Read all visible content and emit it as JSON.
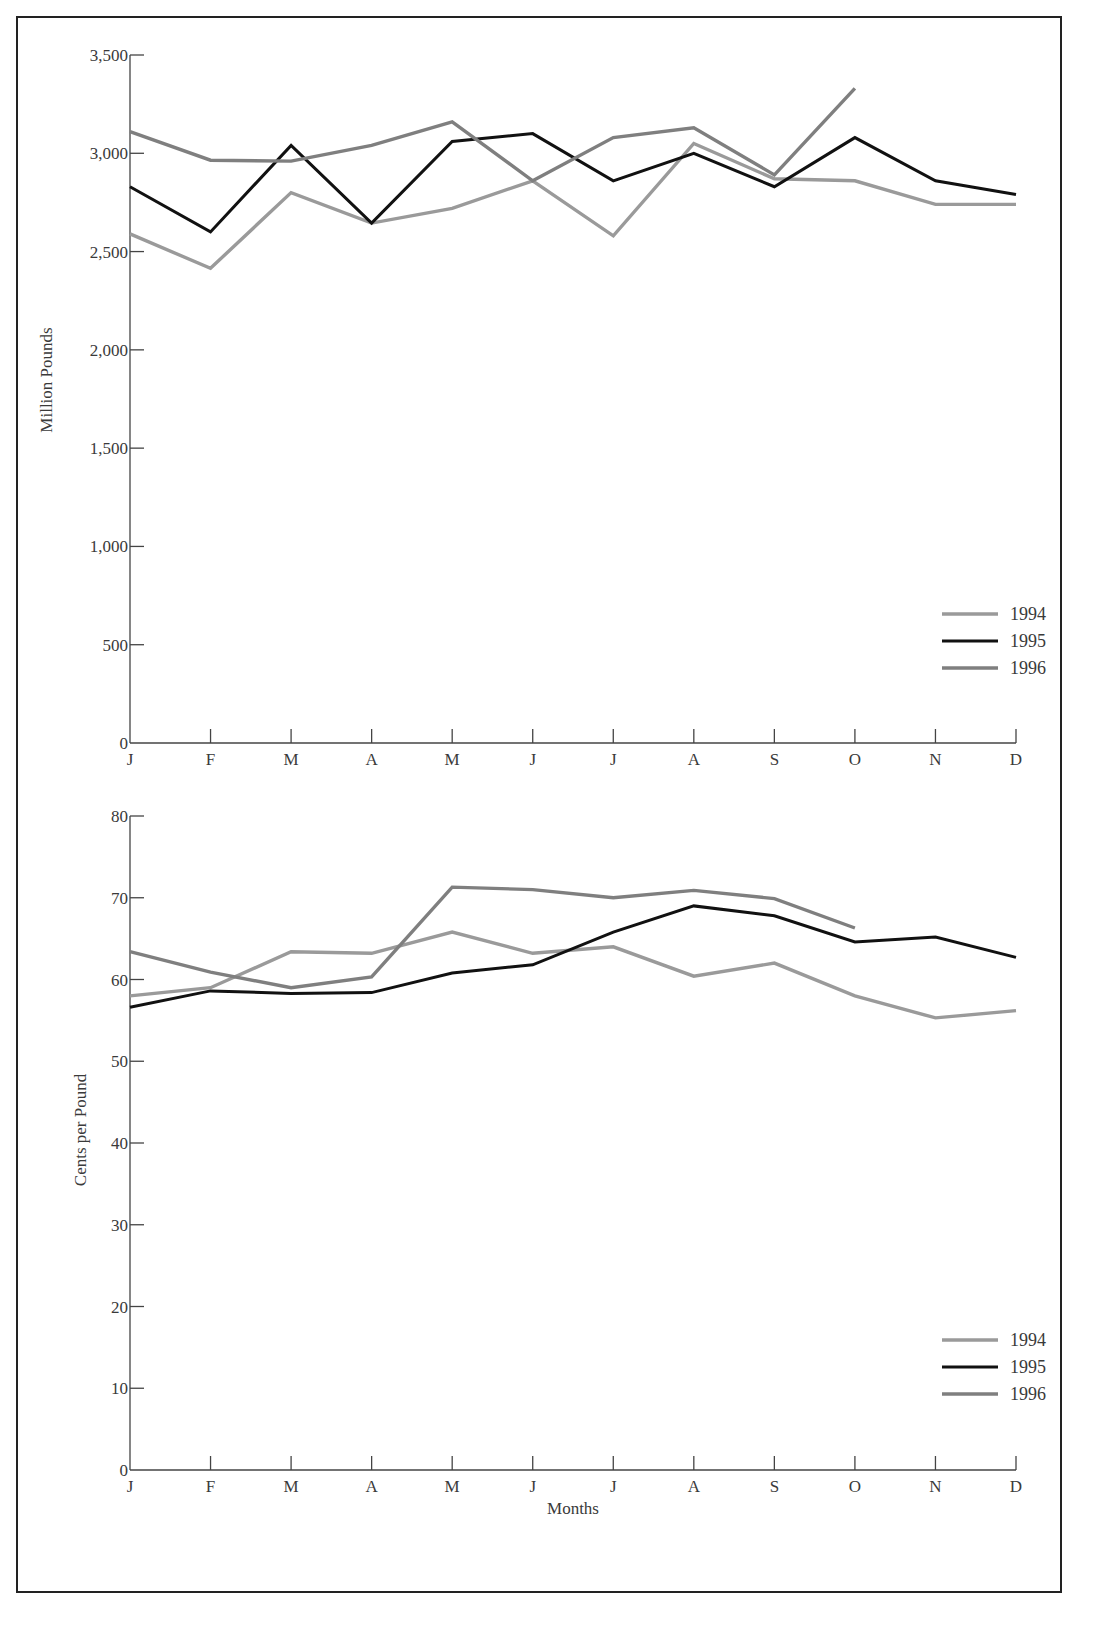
{
  "chart_data": [
    {
      "type": "line",
      "title": "",
      "xlabel": "",
      "ylabel": "Million Pounds",
      "categories": [
        "J",
        "F",
        "M",
        "A",
        "M",
        "J",
        "J",
        "A",
        "S",
        "O",
        "N",
        "D"
      ],
      "ylim": [
        0,
        3500
      ],
      "yticks": [
        0,
        500,
        1000,
        1500,
        2000,
        2500,
        3000,
        3500
      ],
      "ytick_labels": [
        "0",
        "500",
        "1,000",
        "1,500",
        "2,000",
        "2,500",
        "3,000",
        "3,500"
      ],
      "grid": false,
      "legend_position": "lower right",
      "values_estimated": true,
      "series": [
        {
          "name": "1994",
          "color": "#9a9a9a",
          "values": [
            2590,
            2415,
            2800,
            2645,
            2720,
            2860,
            2580,
            3050,
            2870,
            2860,
            2740,
            2740
          ]
        },
        {
          "name": "1995",
          "color": "#111111",
          "values": [
            2830,
            2600,
            3040,
            2645,
            3060,
            3100,
            2860,
            3000,
            2830,
            3080,
            2860,
            2790
          ]
        },
        {
          "name": "1996",
          "color": "#7f7f7f",
          "values": [
            3110,
            2965,
            2960,
            3040,
            3160,
            2860,
            3080,
            3130,
            2890,
            3330,
            null,
            null
          ]
        }
      ]
    },
    {
      "type": "line",
      "title": "",
      "xlabel": "Months",
      "ylabel": "Cents per Pound",
      "categories": [
        "J",
        "F",
        "M",
        "A",
        "M",
        "J",
        "J",
        "A",
        "S",
        "O",
        "N",
        "D"
      ],
      "ylim": [
        0,
        80
      ],
      "yticks": [
        0,
        10,
        20,
        30,
        40,
        50,
        60,
        70,
        80
      ],
      "ytick_labels": [
        "0",
        "10",
        "20",
        "30",
        "40",
        "50",
        "60",
        "70",
        "80"
      ],
      "grid": false,
      "legend_position": "lower right",
      "values_estimated": true,
      "series": [
        {
          "name": "1994",
          "color": "#9a9a9a",
          "values": [
            58.0,
            59.0,
            63.4,
            63.2,
            65.8,
            63.2,
            64.0,
            60.4,
            62.0,
            58.0,
            55.3,
            56.2
          ]
        },
        {
          "name": "1995",
          "color": "#111111",
          "values": [
            56.6,
            58.6,
            58.3,
            58.4,
            60.8,
            61.8,
            65.8,
            69.0,
            67.8,
            64.6,
            65.2,
            62.7
          ]
        },
        {
          "name": "1996",
          "color": "#7f7f7f",
          "values": [
            63.4,
            60.9,
            59.0,
            60.3,
            71.3,
            71.0,
            70.0,
            70.9,
            69.9,
            66.3,
            null,
            null
          ]
        }
      ]
    }
  ]
}
